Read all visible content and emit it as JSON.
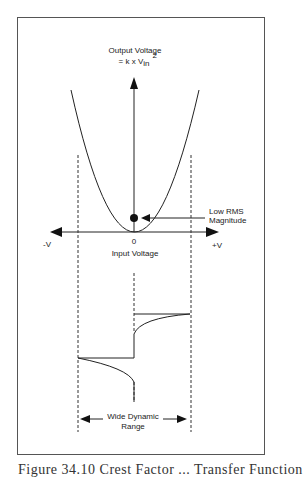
{
  "figure": {
    "y_axis_label_line1": "Output Voltage",
    "y_axis_formula_prefix": "= k x V",
    "y_axis_formula_subscript": "in",
    "y_axis_formula_superscript": "2",
    "x_axis_label": "Input Voltage",
    "x_origin_label": "0",
    "x_negative_label": "-V",
    "x_positive_label": "+V",
    "annotation_line1": "Low RMS",
    "annotation_line2": "Magnitude",
    "range_label_line1": "Wide Dynamic",
    "range_label_line2": "Range",
    "caption": "Figure 34.10 Crest Factor ... Transfer Function"
  },
  "colors": {
    "line": "#222222",
    "frame": "#555555"
  }
}
